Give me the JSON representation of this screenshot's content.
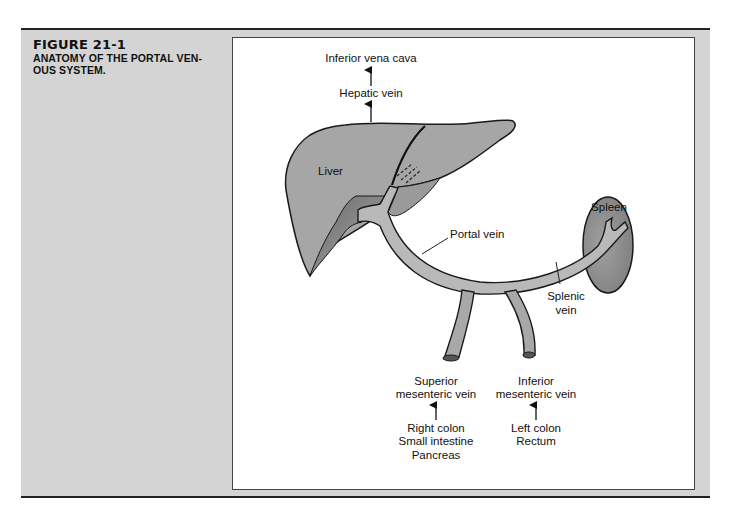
{
  "figure": {
    "number": "FIGURE 21-1",
    "title_line1": "ANATOMY OF THE PORTAL VEN-",
    "title_line2": "OUS SYSTEM."
  },
  "labels": {
    "ivc": "Inferior vena cava",
    "hepatic_vein": "Hepatic vein",
    "liver": "Liver",
    "spleen": "Spleen",
    "portal_vein": "Portal vein",
    "splenic_vein_1": "Splenic",
    "splenic_vein_2": "vein",
    "smv_1": "Superior",
    "smv_2": "mesenteric vein",
    "imv_1": "Inferior",
    "imv_2": "mesenteric vein",
    "smv_sources": [
      "Right colon",
      "Small intestine",
      "Pancreas"
    ],
    "imv_sources": [
      "Left colon",
      "Rectum"
    ]
  },
  "colors": {
    "panel_bg": "#d4d4d4",
    "organ_fill": "#a3a3a3",
    "organ_dark": "#7a7a7a",
    "vein_fill": "#b8b8b8",
    "stroke": "#1a1a1a"
  }
}
